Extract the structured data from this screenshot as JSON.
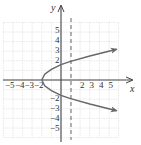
{
  "chart_data": {
    "type": "line",
    "title": "",
    "xlabel": "x",
    "ylabel": "y",
    "xlim": [
      -6,
      6
    ],
    "ylim": [
      -6,
      6
    ],
    "grid": true,
    "x_tick_labels": [
      "-5",
      "-4",
      "-3",
      "-2",
      "2",
      "3",
      "4",
      "5"
    ],
    "y_tick_labels": [
      "5",
      "4",
      "3",
      "2",
      "-2",
      "-3",
      "-4",
      "-5"
    ],
    "series": [
      {
        "name": "parabola opening right",
        "style": "solid",
        "color": "#666666",
        "vertex": [
          -2,
          0
        ],
        "points": [
          [
            5.8,
            3.2
          ],
          [
            3,
            2.5
          ],
          [
            1,
            1.95
          ],
          [
            0,
            1.6
          ],
          [
            -1,
            1.1
          ],
          [
            -1.7,
            0.6
          ],
          [
            -2,
            0
          ],
          [
            -1.7,
            -0.6
          ],
          [
            -1,
            -1.1
          ],
          [
            0,
            -1.6
          ],
          [
            1,
            -1.95
          ],
          [
            3,
            -2.5
          ],
          [
            5.8,
            -3.2
          ]
        ],
        "arrows": [
          "upper-right",
          "lower-right"
        ]
      },
      {
        "name": "dashed vertical line",
        "style": "dashed",
        "color": "#666666",
        "x": 1
      }
    ]
  },
  "labels": {
    "x_axis": "x",
    "y_axis": "y",
    "x_ticks": [
      {
        "label": "−5",
        "value": -5
      },
      {
        "label": "−4",
        "value": -4
      },
      {
        "label": "−3",
        "value": -3
      },
      {
        "label": "−2",
        "value": -2
      },
      {
        "label": "2",
        "value": 2
      },
      {
        "label": "3",
        "value": 3
      },
      {
        "label": "4",
        "value": 4
      },
      {
        "label": "5",
        "value": 5
      }
    ],
    "y_ticks": [
      {
        "label": "5",
        "value": 5
      },
      {
        "label": "4",
        "value": 4
      },
      {
        "label": "3",
        "value": 3
      },
      {
        "label": "2",
        "value": 2
      },
      {
        "label": "−2",
        "value": -2
      },
      {
        "label": "−3",
        "value": -3
      },
      {
        "label": "−4",
        "value": -4
      },
      {
        "label": "−5",
        "value": -5
      }
    ]
  }
}
